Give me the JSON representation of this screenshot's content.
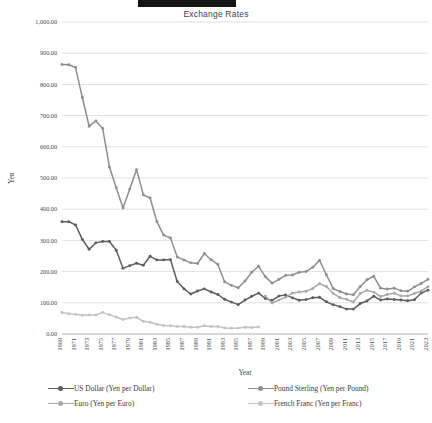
{
  "top_bar": {
    "present": true
  },
  "chart_data": {
    "type": "line",
    "title": "Exchange Rates",
    "xlabel": "Year",
    "ylabel": "Yen",
    "ylim": [
      0,
      1000
    ],
    "ytick_step": 100,
    "ytick_labels": [
      "0.00",
      "100.00",
      "200.00",
      "300.00",
      "400.00",
      "500.00",
      "600.00",
      "700.00",
      "800.00",
      "900.00",
      "1,000.00"
    ],
    "grid": true,
    "legend_position": "bottom",
    "x_start": 1969,
    "x_end": 2023,
    "xtick_labels": [
      "1969",
      "1971",
      "1973",
      "1975",
      "1977",
      "1979",
      "1981",
      "1983",
      "1985",
      "1987",
      "1989",
      "1991",
      "1993",
      "1995",
      "1997",
      "1999",
      "2001",
      "2003",
      "2005",
      "2007",
      "2009",
      "2011",
      "2013",
      "2015",
      "2017",
      "2019",
      "2021",
      "2023"
    ],
    "x": [
      1969,
      1970,
      1971,
      1972,
      1973,
      1974,
      1975,
      1976,
      1977,
      1978,
      1979,
      1980,
      1981,
      1982,
      1983,
      1984,
      1985,
      1986,
      1987,
      1988,
      1989,
      1990,
      1991,
      1992,
      1993,
      1994,
      1995,
      1996,
      1997,
      1998,
      1999,
      2000,
      2001,
      2002,
      2003,
      2004,
      2005,
      2006,
      2007,
      2008,
      2009,
      2010,
      2011,
      2012,
      2013,
      2014,
      2015,
      2016,
      2017,
      2018,
      2019,
      2020,
      2021,
      2022,
      2023
    ],
    "series": [
      {
        "name": "US Dollar  (Yen per Dollar)",
        "legend_label": "US Dollar  (Yen per Dollar)",
        "color": "#5d5d5d",
        "values": [
          360.0,
          360.0,
          349.33,
          303.17,
          271.7,
          292.08,
          296.79,
          296.55,
          268.51,
          210.44,
          219.14,
          226.74,
          220.54,
          249.08,
          237.51,
          237.52,
          238.54,
          168.52,
          144.64,
          128.15,
          137.96,
          144.79,
          134.71,
          126.65,
          111.2,
          102.21,
          94.06,
          108.78,
          120.99,
          130.91,
          113.91,
          107.77,
          121.53,
          125.39,
          115.93,
          108.19,
          110.22,
          116.3,
          117.75,
          103.36,
          93.57,
          87.78,
          79.81,
          79.79,
          97.6,
          105.94,
          121.04,
          108.79,
          112.17,
          110.42,
          109.01,
          106.77,
          109.75,
          131.5,
          140.5
        ]
      },
      {
        "name": "Pound Sterling  (Yen per Pound)",
        "legend_label": "Pound Sterling  (Yen per Pound)",
        "color": "#8e8e8e",
        "values": [
          864.0,
          863.0,
          854.0,
          758.0,
          666.0,
          683.0,
          659.0,
          535.0,
          469.0,
          404.0,
          465.0,
          527.0,
          446.0,
          436.0,
          360.0,
          317.0,
          308.0,
          247.0,
          237.0,
          228.0,
          226.0,
          258.0,
          238.0,
          223.0,
          167.0,
          156.0,
          148.0,
          170.0,
          198.0,
          217.0,
          184.0,
          163.0,
          175.0,
          188.0,
          189.0,
          198.0,
          200.0,
          214.0,
          236.0,
          190.0,
          146.0,
          136.0,
          128.0,
          126.0,
          152.0,
          174.0,
          185.0,
          147.0,
          144.0,
          147.0,
          139.0,
          137.0,
          151.0,
          162.0,
          175.0
        ]
      },
      {
        "name": "Euro  (Yen per Euro)",
        "legend_label": "Euro  (Yen per Euro)",
        "color": "#a8a8a8",
        "values": [
          null,
          null,
          null,
          null,
          null,
          null,
          null,
          null,
          null,
          null,
          null,
          null,
          null,
          null,
          null,
          null,
          null,
          null,
          null,
          null,
          null,
          null,
          null,
          null,
          null,
          null,
          null,
          null,
          null,
          null,
          121.32,
          99.47,
          108.68,
          118.06,
          130.97,
          134.44,
          136.85,
          146.02,
          161.25,
          152.45,
          130.34,
          116.24,
          111.0,
          102.61,
          129.66,
          140.42,
          134.31,
          120.2,
          126.71,
          130.4,
          122.06,
          121.85,
          129.88,
          138.03,
          151.99
        ]
      },
      {
        "name": "French Franc  (Yen per Franc)",
        "legend_label": "French Franc  (Yen per Franc)",
        "color": "#c2c2c2",
        "values": [
          69.0,
          65.0,
          63.0,
          60.0,
          61.0,
          60.8,
          69.2,
          62.0,
          54.7,
          46.7,
          51.5,
          53.7,
          40.6,
          37.9,
          31.2,
          27.2,
          26.6,
          24.4,
          24.1,
          21.5,
          21.6,
          26.6,
          23.9,
          23.9,
          19.6,
          18.4,
          18.9,
          21.3,
          20.7,
          22.2,
          null,
          null,
          null,
          null,
          null,
          null,
          null,
          null,
          null,
          null,
          null,
          null,
          null,
          null,
          null,
          null,
          null,
          null,
          null,
          null,
          null,
          null,
          null,
          null,
          null
        ]
      }
    ]
  },
  "legend": {
    "items": [
      {
        "label": "US Dollar  (Yen per Dollar)",
        "color": "#5d5d5d"
      },
      {
        "label": "Pound Sterling  (Yen per Pound)",
        "color": "#8e8e8e"
      },
      {
        "label": "Euro  (Yen per Euro)",
        "color": "#a8a8a8"
      },
      {
        "label": "French Franc  (Yen per Franc)",
        "color": "#c2c2c2"
      }
    ]
  }
}
